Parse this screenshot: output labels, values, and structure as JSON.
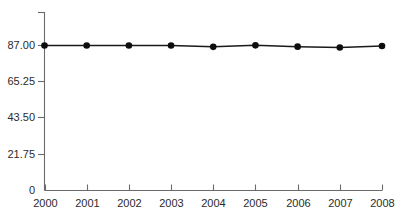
{
  "chart_data": {
    "type": "line",
    "title": "",
    "subtitle": "",
    "xlabel": "",
    "ylabel": "",
    "categories": [
      "2000",
      "2001",
      "2002",
      "2003",
      "2004",
      "2005",
      "2006",
      "2007",
      "2008"
    ],
    "x": [
      2000,
      2001,
      2002,
      2003,
      2004,
      2005,
      2006,
      2007,
      2008
    ],
    "values": [
      87.0,
      87.0,
      87.0,
      87.0,
      86.2,
      87.1,
      86.3,
      85.8,
      86.7
    ],
    "series": [
      {
        "name": "",
        "values": [
          87.0,
          87.0,
          87.0,
          87.0,
          86.2,
          87.1,
          86.3,
          85.8,
          86.7
        ]
      }
    ],
    "ylim": [
      0,
      92
    ],
    "xlim": [
      2000,
      2008
    ],
    "ytick_labels": [
      "0",
      "21.75",
      "43.50",
      "65.25",
      "87.00"
    ],
    "ytick_values": [
      0,
      21.75,
      43.5,
      65.25,
      87.0
    ],
    "xtick_labels": [
      "2000",
      "2001",
      "2002",
      "2003",
      "2004",
      "2005",
      "2006",
      "2007",
      "2008"
    ],
    "grid": false,
    "legend": null,
    "legend_position": "none",
    "marker": "circle",
    "line_color": "#1a1a1a",
    "marker_color": "#0d0d0d",
    "axis_color": "#6b6b6b",
    "text_color": "#2b2b2b",
    "background_color": "#ffffff"
  },
  "axes": {
    "y_labels": [
      "87.00",
      "65.25",
      "43.50",
      "21.75",
      "0"
    ],
    "x_labels": [
      "2000",
      "2001",
      "2002",
      "2003",
      "2004",
      "2005",
      "2006",
      "2007",
      "2008"
    ]
  }
}
